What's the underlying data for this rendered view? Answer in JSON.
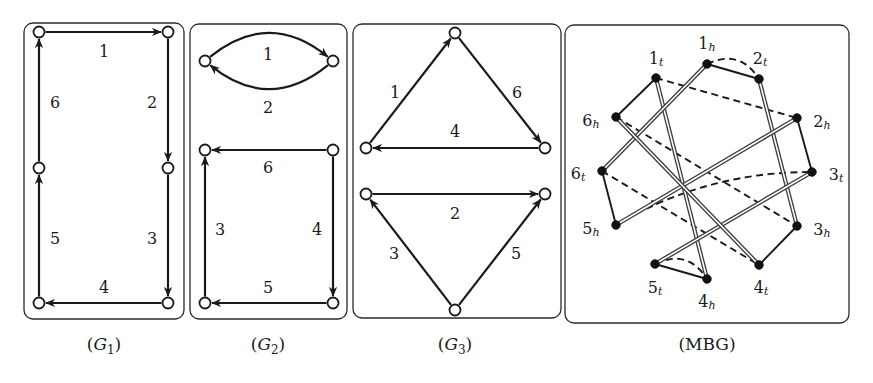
{
  "figure": {
    "panels": [
      {
        "id": "G1",
        "caption_main": "G",
        "caption_sub": "1",
        "caption_italic": true,
        "frame": {
          "x": 24,
          "y": 23,
          "w": 160,
          "h": 296,
          "r": 9
        },
        "caption_pos": {
          "x": 104,
          "y": 350
        },
        "nodes": [
          {
            "id": "a",
            "x": 39,
            "y": 32
          },
          {
            "id": "b",
            "x": 168,
            "y": 32
          },
          {
            "id": "c",
            "x": 168,
            "y": 168
          },
          {
            "id": "d",
            "x": 168,
            "y": 303
          },
          {
            "id": "e",
            "x": 39,
            "y": 303
          },
          {
            "id": "f",
            "x": 39,
            "y": 168
          }
        ],
        "edges": [
          {
            "label": "1",
            "from": "a",
            "to": "b",
            "label_pos": {
              "x": 104,
              "y": 51
            }
          },
          {
            "label": "2",
            "from": "b",
            "to": "c",
            "label_pos": {
              "x": 152,
              "y": 102
            }
          },
          {
            "label": "3",
            "from": "c",
            "to": "d",
            "label_pos": {
              "x": 152,
              "y": 238
            }
          },
          {
            "label": "4",
            "from": "d",
            "to": "e",
            "label_pos": {
              "x": 104,
              "y": 287
            }
          },
          {
            "label": "5",
            "from": "e",
            "to": "f",
            "label_pos": {
              "x": 55,
              "y": 238
            }
          },
          {
            "label": "6",
            "from": "f",
            "to": "a",
            "label_pos": {
              "x": 55,
              "y": 102
            }
          }
        ]
      },
      {
        "id": "G2",
        "caption_main": "G",
        "caption_sub": "2",
        "caption_italic": true,
        "frame": {
          "x": 190,
          "y": 24,
          "w": 157,
          "h": 295,
          "r": 9
        },
        "caption_pos": {
          "x": 268,
          "y": 350
        },
        "nodes": [
          {
            "id": "a",
            "x": 205,
            "y": 61
          },
          {
            "id": "b",
            "x": 333,
            "y": 61
          },
          {
            "id": "c",
            "x": 205,
            "y": 150
          },
          {
            "id": "d",
            "x": 333,
            "y": 150
          },
          {
            "id": "e",
            "x": 333,
            "y": 303
          },
          {
            "id": "f",
            "x": 205,
            "y": 303
          }
        ],
        "edges": [
          {
            "label": "1",
            "from": "a",
            "to": "b",
            "curve": -26,
            "label_pos": {
              "x": 268,
              "y": 54
            }
          },
          {
            "label": "2",
            "from": "b",
            "to": "a",
            "curve": -26,
            "label_pos": {
              "x": 268,
              "y": 107
            }
          },
          {
            "label": "6",
            "from": "d",
            "to": "c",
            "label_pos": {
              "x": 268,
              "y": 167
            }
          },
          {
            "label": "4",
            "from": "d",
            "to": "e",
            "label_pos": {
              "x": 317,
              "y": 229
            }
          },
          {
            "label": "5",
            "from": "e",
            "to": "f",
            "label_pos": {
              "x": 268,
              "y": 287
            }
          },
          {
            "label": "3",
            "from": "f",
            "to": "c",
            "label_pos": {
              "x": 220,
              "y": 229
            }
          }
        ]
      },
      {
        "id": "G3",
        "caption_main": "G",
        "caption_sub": "3",
        "caption_italic": true,
        "frame": {
          "x": 353,
          "y": 24,
          "w": 208,
          "h": 294,
          "r": 9
        },
        "caption_pos": {
          "x": 455,
          "y": 350
        },
        "nodes": [
          {
            "id": "t",
            "x": 455,
            "y": 33
          },
          {
            "id": "l",
            "x": 366,
            "y": 148
          },
          {
            "id": "r",
            "x": 545,
            "y": 148
          },
          {
            "id": "l2",
            "x": 366,
            "y": 194
          },
          {
            "id": "r2",
            "x": 545,
            "y": 194
          },
          {
            "id": "b",
            "x": 455,
            "y": 310
          }
        ],
        "edges": [
          {
            "label": "1",
            "from": "l",
            "to": "t",
            "label_pos": {
              "x": 395,
              "y": 92
            }
          },
          {
            "label": "6",
            "from": "t",
            "to": "r",
            "label_pos": {
              "x": 517,
              "y": 92
            }
          },
          {
            "label": "4",
            "from": "r",
            "to": "l",
            "label_pos": {
              "x": 455,
              "y": 131
            }
          },
          {
            "label": "2",
            "from": "l2",
            "to": "r2",
            "label_pos": {
              "x": 455,
              "y": 213
            }
          },
          {
            "label": "3",
            "from": "b",
            "to": "l2",
            "label_pos": {
              "x": 394,
              "y": 253
            }
          },
          {
            "label": "5",
            "from": "b",
            "to": "r2",
            "label_pos": {
              "x": 516,
              "y": 253
            }
          }
        ]
      }
    ],
    "mbg": {
      "id": "MBG",
      "caption": "(MBG)",
      "frame": {
        "x": 565,
        "y": 25,
        "w": 284,
        "h": 298,
        "r": 9
      },
      "caption_pos": {
        "x": 707,
        "y": 350
      },
      "nodes": [
        {
          "id": "1t",
          "main": "1",
          "sub": "t",
          "x": 656,
          "y": 78,
          "lx": 656,
          "ly": 58
        },
        {
          "id": "1h",
          "main": "1",
          "sub": "h",
          "x": 707,
          "y": 64,
          "lx": 707,
          "ly": 43
        },
        {
          "id": "2t",
          "main": "2",
          "sub": "t",
          "x": 759,
          "y": 79,
          "lx": 760,
          "ly": 58
        },
        {
          "id": "2h",
          "main": "2",
          "sub": "h",
          "x": 797,
          "y": 118,
          "lx": 822,
          "ly": 121
        },
        {
          "id": "3t",
          "main": "3",
          "sub": "t",
          "x": 812,
          "y": 172,
          "lx": 836,
          "ly": 174
        },
        {
          "id": "3h",
          "main": "3",
          "sub": "h",
          "x": 797,
          "y": 226,
          "lx": 822,
          "ly": 229
        },
        {
          "id": "4t",
          "main": "4",
          "sub": "t",
          "x": 759,
          "y": 265,
          "lx": 761,
          "ly": 287
        },
        {
          "id": "4h",
          "main": "4",
          "sub": "h",
          "x": 707,
          "y": 279,
          "lx": 707,
          "ly": 301
        },
        {
          "id": "5t",
          "main": "5",
          "sub": "t",
          "x": 655,
          "y": 264,
          "lx": 655,
          "ly": 287
        },
        {
          "id": "5h",
          "main": "5",
          "sub": "h",
          "x": 616,
          "y": 225,
          "lx": 591,
          "ly": 228
        },
        {
          "id": "6t",
          "main": "6",
          "sub": "t",
          "x": 602,
          "y": 171,
          "lx": 578,
          "ly": 173
        },
        {
          "id": "6h",
          "main": "6",
          "sub": "h",
          "x": 616,
          "y": 117,
          "lx": 591,
          "ly": 120
        }
      ],
      "edges": {
        "solid": [
          [
            "1t",
            "6h"
          ],
          [
            "1h",
            "2t"
          ],
          [
            "2h",
            "3t"
          ],
          [
            "3h",
            "4t"
          ],
          [
            "5t",
            "4h"
          ],
          [
            "6t",
            "5h"
          ]
        ],
        "double": [
          [
            "1t",
            "4h"
          ],
          [
            "1h",
            "6t"
          ],
          [
            "2t",
            "3h"
          ],
          [
            "2h",
            "5h"
          ],
          [
            "3t",
            "5t"
          ],
          [
            "6h",
            "4t"
          ]
        ],
        "dashed": [
          {
            "from": "1h",
            "to": "2t",
            "curve": -12
          },
          {
            "from": "1t",
            "to": "2h",
            "curve": 0
          },
          {
            "from": "6h",
            "to": "3h",
            "curve": 0
          },
          {
            "from": "6t",
            "to": "4t",
            "curve": 0
          },
          {
            "from": "5h",
            "to": "3t",
            "curve": -14
          },
          {
            "from": "5t",
            "to": "4h",
            "curve": -12
          }
        ]
      }
    }
  }
}
